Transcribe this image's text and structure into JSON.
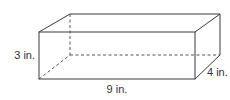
{
  "figure": {
    "type": "rectangular-prism",
    "colors": {
      "line": "#3a3a3a",
      "hidden_line": "#555555",
      "text": "#333333",
      "background": "#ffffff"
    }
  },
  "labels": {
    "height": "3 in.",
    "length": "9 in.",
    "width": "4 in."
  },
  "dimensions": {
    "length": 9,
    "width": 4,
    "height": 3,
    "unit": "in."
  }
}
